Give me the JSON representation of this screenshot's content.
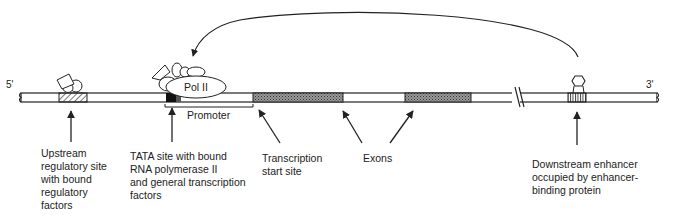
{
  "diagram": {
    "type": "gene-regulation-schematic",
    "ends": {
      "five_prime": "5'",
      "three_prime": "3'"
    },
    "polymerase_label": "Pol II",
    "promoter_label": "Promoter",
    "labels": {
      "upstream": "Upstream\nregulatory site\nwith bound\nregulatory\nfactors",
      "tata": "TATA site with bound\nRNA polymerase II\nand general transcription\nfactors",
      "tss": "Transcription\nstart site",
      "exons": "Exons",
      "enhancer": "Downstream enhancer\noccupied by enhancer-\nbinding protein"
    },
    "colors": {
      "line": "#222222",
      "background": "#ffffff",
      "exon_fill": "#777777",
      "tata_fill": "#111111"
    }
  }
}
